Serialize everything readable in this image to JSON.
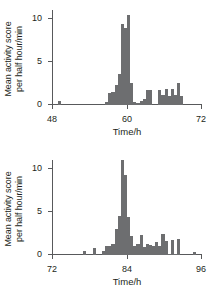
{
  "figure": {
    "bar_color": "#6d6e70",
    "axis_color": "#58595b",
    "text_color": "#231f20"
  },
  "chart_data": [
    {
      "type": "bar",
      "panel": "top",
      "title": "",
      "xlabel": "Time/h",
      "ylabel_line1": "Mean activity score",
      "ylabel_line2": "per half hour/min",
      "xlim": [
        48,
        72
      ],
      "ylim": [
        0,
        11
      ],
      "xticks": [
        48,
        60,
        72
      ],
      "xtick_labels": [
        "48",
        "60",
        "72"
      ],
      "yticks": [
        0,
        5,
        10
      ],
      "ytick_labels": [
        "0",
        "5",
        "10"
      ],
      "grid": false,
      "legend": "none",
      "bin_width": 0.5,
      "x": [
        49.0,
        49.5,
        56.5,
        57.0,
        57.5,
        58.0,
        58.5,
        59.0,
        59.5,
        60.0,
        60.5,
        61.0,
        61.5,
        62.0,
        62.5,
        63.0,
        63.5,
        64.0,
        64.5,
        65.0,
        65.5,
        66.0,
        66.5,
        67.0,
        67.5,
        68.0,
        68.5,
        69.0,
        69.5
      ],
      "values": [
        0.45,
        0.0,
        0.35,
        1.4,
        1.5,
        2.3,
        3.6,
        9.4,
        8.9,
        10.4,
        2.6,
        0.4,
        0.25,
        0.5,
        0.75,
        1.7,
        1.7,
        0.0,
        0.0,
        1.7,
        1.2,
        1.8,
        1.1,
        1.9,
        1.15,
        2.5,
        1.1,
        0.0,
        0.0
      ]
    },
    {
      "type": "bar",
      "panel": "bottom",
      "title": "",
      "xlabel": "Time/h",
      "ylabel_line1": "Mean activity score",
      "ylabel_line2": "per half hour/min",
      "xlim": [
        72,
        96
      ],
      "ylim": [
        0,
        11
      ],
      "xticks": [
        72,
        84,
        96
      ],
      "xtick_labels": [
        "72",
        "84",
        "96"
      ],
      "yticks": [
        0,
        5,
        10
      ],
      "ytick_labels": [
        "0",
        "5",
        "10"
      ],
      "grid": false,
      "legend": "none",
      "bin_width": 0.5,
      "x": [
        77.0,
        78.5,
        80.0,
        80.5,
        81.0,
        81.5,
        82.0,
        82.5,
        83.0,
        83.5,
        84.0,
        84.5,
        85.0,
        85.5,
        86.0,
        86.5,
        87.0,
        87.5,
        88.0,
        88.5,
        89.0,
        89.5,
        90.0,
        90.5,
        91.0,
        91.5,
        92.0,
        94.5
      ],
      "values": [
        0.45,
        0.85,
        0.5,
        1.0,
        1.1,
        1.3,
        3.0,
        4.5,
        12.2,
        9.3,
        4.4,
        2.2,
        1.0,
        1.3,
        2.3,
        0.9,
        1.3,
        1.2,
        1.0,
        1.5,
        1.1,
        2.4,
        1.6,
        0.15,
        1.7,
        0.1,
        1.9,
        0.3
      ]
    }
  ]
}
